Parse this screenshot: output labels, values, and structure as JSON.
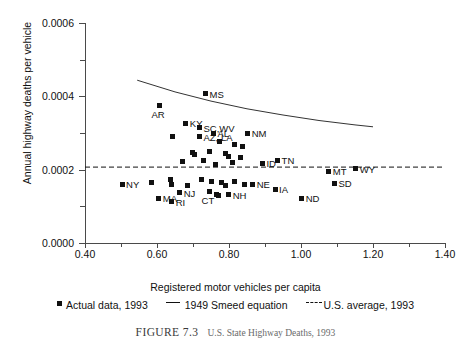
{
  "figure": {
    "caption_number": "FIGURE 7.3",
    "caption_text": "U.S. State Highway Deaths, 1993"
  },
  "legend": {
    "items": [
      {
        "marker": "square",
        "label": "Actual data, 1993"
      },
      {
        "marker": "solid-line",
        "label": "1949 Smeed equation"
      },
      {
        "marker": "dashed-line",
        "label": "U.S. average, 1993"
      }
    ]
  },
  "chart_data": {
    "type": "scatter",
    "title": "",
    "xlabel": "Registered motor vehicles per capita",
    "ylabel": "Annual highway deaths per vehicle",
    "xlim": [
      0.4,
      1.4
    ],
    "ylim": [
      0.0,
      0.0006
    ],
    "xticks": [
      "0.40",
      "0.60",
      "0.80",
      "1.00",
      "1.20",
      "1.40"
    ],
    "xtick_values": [
      0.4,
      0.6,
      0.8,
      1.0,
      1.2,
      1.4
    ],
    "yticks": [
      "0.0000",
      "0.0002",
      "0.0004",
      "0.0006"
    ],
    "ytick_values": [
      0.0,
      0.0002,
      0.0004,
      0.0006
    ],
    "yminor_values": [
      0.0001,
      0.0003,
      0.0005
    ],
    "grid": false,
    "legend_position": "below-axis",
    "series": [
      {
        "name": "Actual data, 1993",
        "type": "scatter",
        "marker": "square",
        "color": "#111111",
        "points": [
          {
            "label": "MS",
            "x": 0.735,
            "y": 0.000407
          },
          {
            "label": "AR",
            "x": 0.607,
            "y": 0.000374
          },
          {
            "label": "KY",
            "x": 0.68,
            "y": 0.000327
          },
          {
            "label": "SC,WV",
            "x": 0.718,
            "y": 0.000314
          },
          {
            "label": "AL",
            "x": 0.757,
            "y": 0.0003
          },
          {
            "label": "NM",
            "x": 0.852,
            "y": 0.0003
          },
          {
            "label": "AZ, LA",
            "x": 0.718,
            "y": 0.00029
          },
          {
            "label": "",
            "x": 0.643,
            "y": 0.000291
          },
          {
            "label": "",
            "x": 0.774,
            "y": 0.000276
          },
          {
            "label": "",
            "x": 0.816,
            "y": 0.00027
          },
          {
            "label": "",
            "x": 0.838,
            "y": 0.000262
          },
          {
            "label": "",
            "x": 0.699,
            "y": 0.000248
          },
          {
            "label": "",
            "x": 0.704,
            "y": 0.000241
          },
          {
            "label": "",
            "x": 0.746,
            "y": 0.000249
          },
          {
            "label": "",
            "x": 0.79,
            "y": 0.000243
          },
          {
            "label": "",
            "x": 0.799,
            "y": 0.000235
          },
          {
            "label": "",
            "x": 0.833,
            "y": 0.000234
          },
          {
            "label": "",
            "x": 0.671,
            "y": 0.000222
          },
          {
            "label": "",
            "x": 0.729,
            "y": 0.000224
          },
          {
            "label": "",
            "x": 0.763,
            "y": 0.000215
          },
          {
            "label": "",
            "x": 0.81,
            "y": 0.000219
          },
          {
            "label": "ID",
            "x": 0.893,
            "y": 0.000218
          },
          {
            "label": "TN",
            "x": 0.935,
            "y": 0.000226
          },
          {
            "label": "MT",
            "x": 1.077,
            "y": 0.000196
          },
          {
            "label": "WY",
            "x": 1.152,
            "y": 0.000202
          },
          {
            "label": "NY",
            "x": 0.503,
            "y": 0.000161
          },
          {
            "label": "",
            "x": 0.585,
            "y": 0.000166
          },
          {
            "label": "",
            "x": 0.638,
            "y": 0.000172
          },
          {
            "label": "",
            "x": 0.641,
            "y": 0.00016
          },
          {
            "label": "",
            "x": 0.685,
            "y": 0.000158
          },
          {
            "label": "",
            "x": 0.724,
            "y": 0.000172
          },
          {
            "label": "",
            "x": 0.752,
            "y": 0.000168
          },
          {
            "label": "",
            "x": 0.78,
            "y": 0.000165
          },
          {
            "label": "",
            "x": 0.791,
            "y": 0.000156
          },
          {
            "label": "",
            "x": 0.816,
            "y": 0.000169
          },
          {
            "label": "",
            "x": 0.843,
            "y": 0.00016
          },
          {
            "label": "NE",
            "x": 0.866,
            "y": 0.000161
          },
          {
            "label": "SD",
            "x": 1.093,
            "y": 0.000163
          },
          {
            "label": "IA",
            "x": 0.928,
            "y": 0.000146
          },
          {
            "label": "NJ",
            "x": 0.663,
            "y": 0.000137
          },
          {
            "label": "CT",
            "x": 0.746,
            "y": 0.00014
          },
          {
            "label": "",
            "x": 0.766,
            "y": 0.000132
          },
          {
            "label": "",
            "x": 0.772,
            "y": 0.000129
          },
          {
            "label": "NH",
            "x": 0.799,
            "y": 0.000132
          },
          {
            "label": "MA",
            "x": 0.605,
            "y": 0.000122
          },
          {
            "label": "RI",
            "x": 0.641,
            "y": 0.000113
          },
          {
            "label": "ND",
            "x": 1.002,
            "y": 0.000122
          }
        ]
      },
      {
        "name": "1949 Smeed equation",
        "type": "line",
        "style": "solid",
        "color": "#333333",
        "x": [
          0.545,
          0.65,
          0.75,
          0.85,
          0.95,
          1.05,
          1.15,
          1.2
        ],
        "y": [
          0.000444,
          0.000412,
          0.000387,
          0.000366,
          0.000349,
          0.000334,
          0.000322,
          0.000317
        ]
      },
      {
        "name": "U.S. average, 1993",
        "type": "hline",
        "style": "dashed",
        "color": "#111111",
        "value": 0.000207,
        "x_start": 0.4,
        "x_end": 1.4
      }
    ]
  }
}
